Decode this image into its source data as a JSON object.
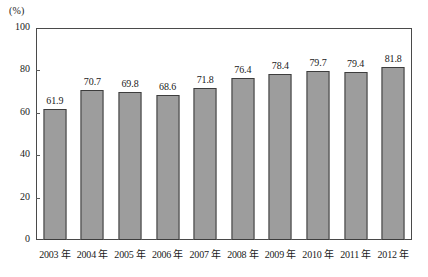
{
  "chart_data": {
    "type": "bar",
    "title": "",
    "subtitle": "",
    "xlabel": "",
    "ylabel": "",
    "unit_label": "(%)",
    "categories": [
      "2003 年",
      "2004 年",
      "2005 年",
      "2006 年",
      "2007 年",
      "2008 年",
      "2009 年",
      "2010 年",
      "2011 年",
      "2012 年"
    ],
    "values": [
      61.9,
      70.7,
      69.8,
      68.6,
      71.8,
      76.4,
      78.4,
      79.7,
      79.4,
      81.8
    ],
    "value_labels": [
      "61.9",
      "70.7",
      "69.8",
      "68.6",
      "71.8",
      "76.4",
      "78.4",
      "79.7",
      "79.4",
      "81.8"
    ],
    "ylim": [
      0,
      100
    ],
    "ytick_values": [
      0,
      20,
      40,
      60,
      80,
      100
    ],
    "ytick_labels": [
      "0",
      "20",
      "40",
      "60",
      "80",
      "100"
    ],
    "grid": false,
    "legend": null,
    "legend_position": "none",
    "series": [
      {
        "name": "",
        "values": [
          61.9,
          70.7,
          69.8,
          68.6,
          71.8,
          76.4,
          78.4,
          79.7,
          79.4,
          81.8
        ]
      }
    ],
    "colors": {
      "bar_fill": "#9d9d9d",
      "bar_border": "#3d3d3d",
      "axis": "#4a4a4a",
      "text": "#1a1a1a",
      "background": "#ffffff"
    }
  }
}
